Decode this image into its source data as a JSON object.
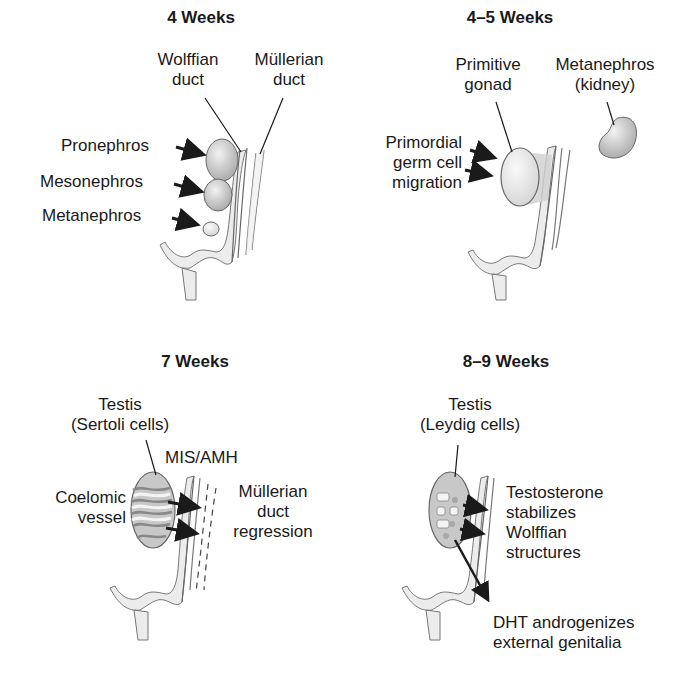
{
  "panels": [
    {
      "title": "4 Weeks",
      "labels": {
        "wolffian": [
          "Wolffian",
          "duct"
        ],
        "mullerian": [
          "Müllerian",
          "duct"
        ],
        "pronephros": "Pronephros",
        "mesonephros": "Mesonephros",
        "metanephros": "Metanephros"
      }
    },
    {
      "title": "4–5 Weeks",
      "labels": {
        "primitive_gonad": [
          "Primitive",
          "gonad"
        ],
        "metanephros_kidney": [
          "Metanephros",
          "(kidney)"
        ],
        "germ_cell": [
          "Primordial",
          "germ cell",
          "migration"
        ]
      }
    },
    {
      "title": "7 Weeks",
      "labels": {
        "testis": [
          "Testis",
          "(Sertoli cells)"
        ],
        "mis_amh": "MIS/AMH",
        "coelomic": [
          "Coelomic",
          "vessel"
        ],
        "regression": [
          "Müllerian",
          "duct",
          "regression"
        ]
      }
    },
    {
      "title": "8–9 Weeks",
      "labels": {
        "testis": [
          "Testis",
          "(Leydig cells)"
        ],
        "testosterone": [
          "Testosterone",
          "stabilizes",
          "Wolffian",
          "structures"
        ],
        "dht": [
          "DHT androgenizes",
          "external genitalia"
        ]
      }
    }
  ],
  "colors": {
    "organ_fill": "#c8c8c8",
    "organ_stroke": "#555555",
    "duct_fill": "#ececec",
    "line": "#1a1a1a"
  }
}
